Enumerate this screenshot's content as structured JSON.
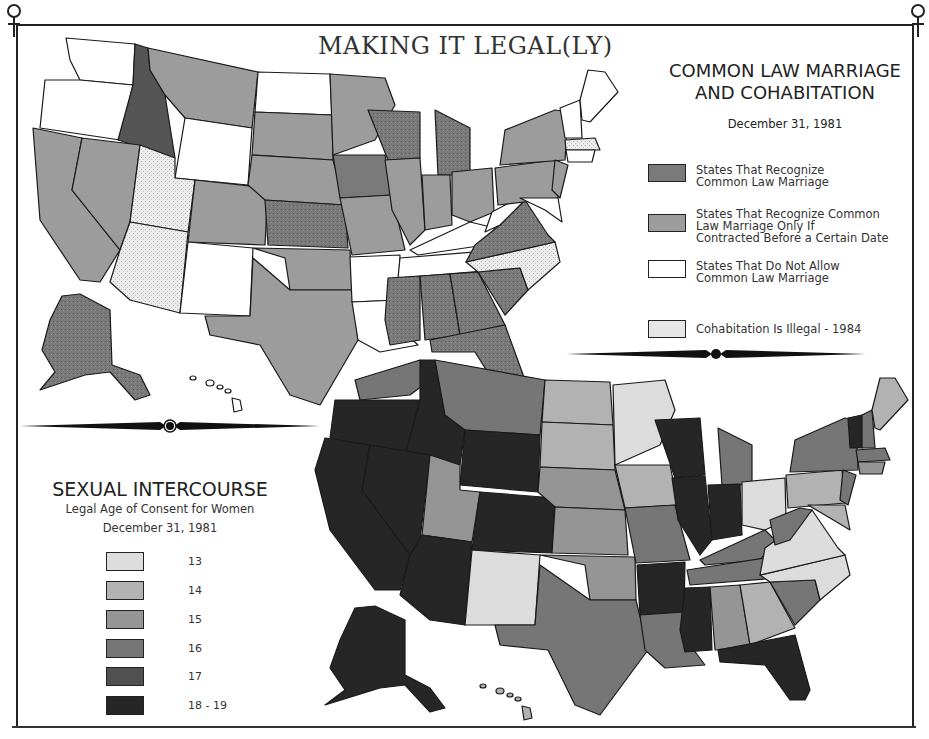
{
  "title": "MAKING IT LEGAL(LY)",
  "colors": {
    "frame": "#222222",
    "clm_recognize": "#7a7a7a",
    "clm_before_date": "#9c9c9c",
    "clm_not_allow": "#ffffff",
    "cohabitation_illegal": "#e6e6e6",
    "age_13": "#dcdcdc",
    "age_14": "#b2b2b2",
    "age_15": "#959595",
    "age_16": "#767676",
    "age_17": "#505050",
    "age_18_19": "#262626"
  },
  "common_law_map": {
    "title_line1": "COMMON LAW MARRIAGE",
    "title_line2": "AND COHABITATION",
    "date": "December 31, 1981",
    "legend": [
      {
        "label": "States That Recognize\nCommon Law Marriage",
        "color": "#7a7a7a",
        "pattern": "speckle-dark"
      },
      {
        "label": "States That Recognize Common\nLaw Marriage Only If\nContracted Before a Certain Date",
        "color": "#9c9c9c",
        "pattern": "solid"
      },
      {
        "label": "States That Do Not Allow\nCommon Law Marriage",
        "color": "#ffffff",
        "pattern": "solid"
      },
      {
        "label": "Cohabitation Is Illegal - 1984",
        "color": "#e6e6e6",
        "pattern": "speckle-light"
      }
    ]
  },
  "consent_map": {
    "title": "SEXUAL INTERCOURSE",
    "subtitle": "Legal Age of Consent for Women",
    "date": "December 31, 1981",
    "legend": [
      {
        "label": "13",
        "color": "#dcdcdc"
      },
      {
        "label": "14",
        "color": "#b2b2b2"
      },
      {
        "label": "15",
        "color": "#959595"
      },
      {
        "label": "16",
        "color": "#767676"
      },
      {
        "label": "17",
        "color": "#505050"
      },
      {
        "label": "18 - 19",
        "color": "#262626"
      }
    ]
  },
  "icons": {
    "corner_left": "venus-symbol",
    "corner_right": "venus-symbol",
    "divider": "ornamental-divider"
  }
}
